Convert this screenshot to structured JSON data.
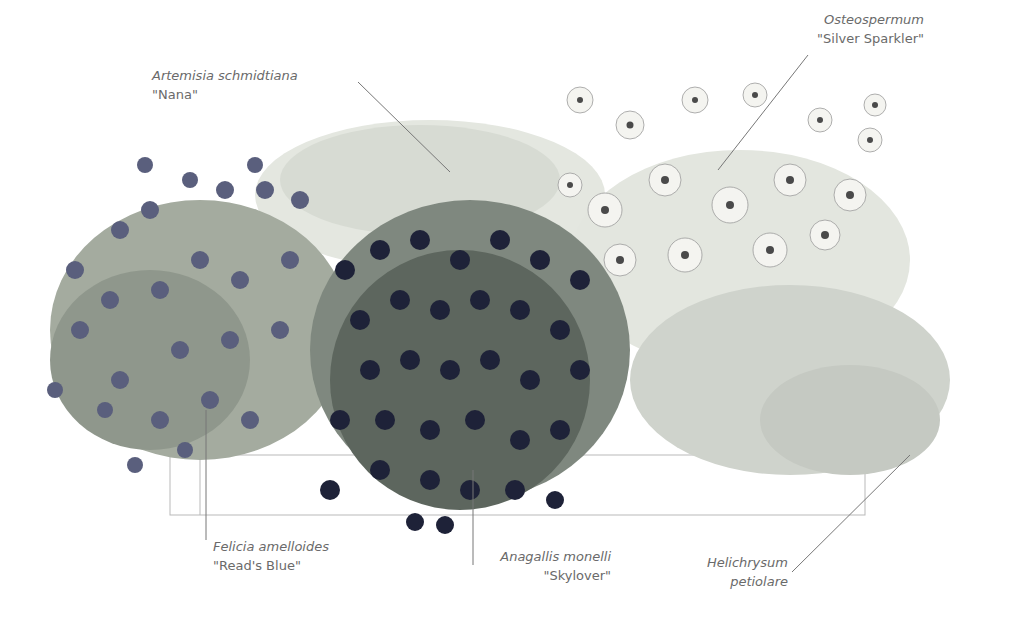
{
  "illustration": {
    "subject": "planting-box-illustration",
    "colors": {
      "felicia": "#5a5f7d",
      "anagallis": "#1e2238",
      "foliage": "#9aa49a",
      "artemisia": "#d7dbd3",
      "osteospermum_petal": "#f4f4f0",
      "osteospermum_center": "#4a4a4a",
      "helichrysum": "#c5c9c2",
      "label_text": "#6a6a6a",
      "leader_line": "#777777"
    }
  },
  "labels": [
    {
      "id": "artemisia",
      "latin": "Artemisia schmidtiana",
      "cultivar": "\"Nana\""
    },
    {
      "id": "osteospermum",
      "latin": "Osteospermum",
      "cultivar": "\"Silver Sparkler\""
    },
    {
      "id": "felicia",
      "latin": "Felicia amelloides",
      "cultivar": "\"Read's Blue\""
    },
    {
      "id": "anagallis",
      "latin": "Anagallis monelli",
      "cultivar": "\"Skylover\""
    },
    {
      "id": "helichrysum",
      "latin": "Helichrysum",
      "cultivar": "petiolare"
    }
  ]
}
